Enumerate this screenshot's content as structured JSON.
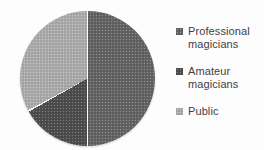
{
  "chart_data": {
    "type": "pie",
    "categories": [
      "Professional magicians",
      "Amateur magicians",
      "Public"
    ],
    "values": [
      50,
      17,
      33
    ],
    "colors": [
      "#646464",
      "#4e4e4e",
      "#acacac"
    ],
    "start_angle_deg": 0,
    "direction": "clockwise",
    "separator_color": "#fbfbfb",
    "background_color": "#fdfdfd",
    "legend_position": "right",
    "legend_text_color": "#3f3f3f",
    "title": ""
  }
}
